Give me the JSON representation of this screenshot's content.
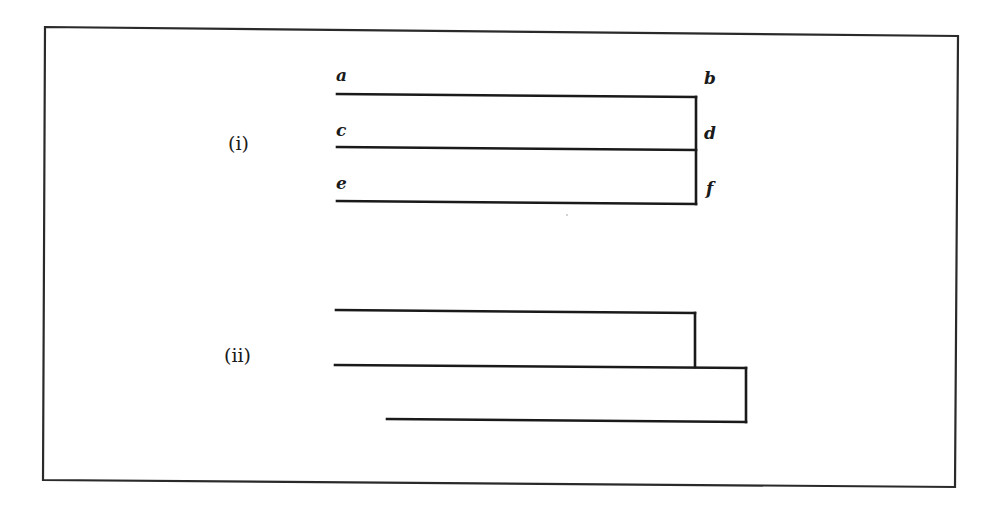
{
  "figure": {
    "frame": {
      "color": "#2a2a2a"
    },
    "panel_i": {
      "label": "(i)",
      "endpoint_labels": {
        "a": "a",
        "b": "b",
        "c": "c",
        "d": "d",
        "e": "e",
        "f": "f"
      },
      "description": "Three parallel horizontal lines a-b, c-d, e-f joined on the right by a single vertical line"
    },
    "panel_ii": {
      "label": "(ii)",
      "description": "Two upper horizontal lines joined by a vertical connector; middle line extends further right and joins a shorter, indented bottom line via a second vertical connector"
    },
    "line_color": "#1a1a1a"
  }
}
